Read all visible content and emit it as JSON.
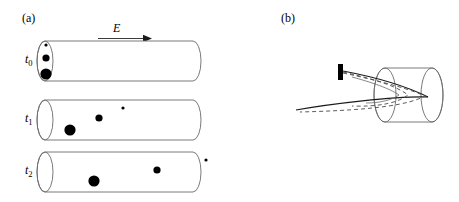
{
  "figure": {
    "panels": [
      {
        "id": "a",
        "label": "(a)",
        "field_label": "E",
        "field_arrow_direction": "right",
        "tubes": [
          {
            "time_label": "t",
            "time_sub": "0",
            "particles": [
              {
                "name": "small-particle",
                "x": 46,
                "y": 45,
                "r": 1.6
              },
              {
                "name": "medium-particle",
                "x": 46,
                "y": 58,
                "r": 3.6
              },
              {
                "name": "large-particle",
                "x": 46,
                "y": 74,
                "r": 5.6
              }
            ]
          },
          {
            "time_label": "t",
            "time_sub": "1",
            "particles": [
              {
                "name": "large-particle",
                "x": 70,
                "y": 130,
                "r": 5.6
              },
              {
                "name": "medium-particle",
                "x": 99,
                "y": 118,
                "r": 3.6
              },
              {
                "name": "small-particle",
                "x": 123,
                "y": 108,
                "r": 1.6
              }
            ]
          },
          {
            "time_label": "t",
            "time_sub": "2",
            "particles": [
              {
                "name": "large-particle",
                "x": 94,
                "y": 181,
                "r": 5.6
              },
              {
                "name": "medium-particle",
                "x": 157,
                "y": 170,
                "r": 3.6
              },
              {
                "name": "small-particle",
                "x": 206,
                "y": 160,
                "r": 1.6
              }
            ]
          }
        ]
      },
      {
        "id": "b",
        "label": "(b)",
        "source_name": "emitter-tip",
        "trajectory_styles": [
          "solid",
          "dashed"
        ]
      }
    ],
    "colors": {
      "stroke": "#3a3a3a",
      "particle_fill": "#000000",
      "source_fill": "#000000",
      "background": "#ffffff"
    }
  }
}
